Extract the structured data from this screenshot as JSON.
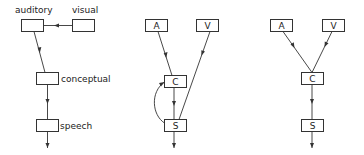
{
  "diagrams": [
    {
      "id": "left",
      "nodes": [
        {
          "id": "auditory",
          "label": "auditory",
          "label_position": "above"
        },
        {
          "id": "visual",
          "label": "visual",
          "label_position": "above"
        },
        {
          "id": "conceptual",
          "label": "conceptual",
          "label_position": "right"
        },
        {
          "id": "speech",
          "label": "speech",
          "label_position": "right"
        }
      ],
      "edges": [
        {
          "from": "visual",
          "to": "auditory"
        },
        {
          "from": "auditory",
          "to": "conceptual"
        },
        {
          "from": "conceptual",
          "to": "speech"
        },
        {
          "from": "speech",
          "to": "output"
        }
      ]
    },
    {
      "id": "middle",
      "nodes": [
        {
          "id": "A",
          "label": "A"
        },
        {
          "id": "V",
          "label": "V"
        },
        {
          "id": "C",
          "label": "C"
        },
        {
          "id": "S",
          "label": "S"
        }
      ],
      "edges": [
        {
          "from": "A",
          "to": "C"
        },
        {
          "from": "V",
          "to": "S"
        },
        {
          "from": "C",
          "to": "S"
        },
        {
          "from": "S",
          "to": "C",
          "curved": true
        },
        {
          "from": "S",
          "to": "output"
        }
      ]
    },
    {
      "id": "right",
      "nodes": [
        {
          "id": "A",
          "label": "A"
        },
        {
          "id": "V",
          "label": "V"
        },
        {
          "id": "C",
          "label": "C"
        },
        {
          "id": "S",
          "label": "S"
        }
      ],
      "edges": [
        {
          "from": "A",
          "to": "C"
        },
        {
          "from": "V",
          "to": "C"
        },
        {
          "from": "C",
          "to": "S"
        },
        {
          "from": "S",
          "to": "output"
        }
      ]
    }
  ]
}
